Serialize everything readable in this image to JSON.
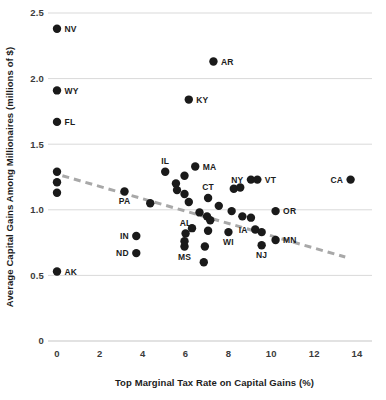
{
  "chart_data": {
    "type": "scatter",
    "title": "",
    "xlabel": "Top Marginal Tax Rate on Capital Gains (%)",
    "ylabel": "Average Capital Gains Among Millionaires (millions of $)",
    "xlim": [
      -0.7,
      14.5
    ],
    "ylim": [
      0,
      2.6
    ],
    "xticks": [
      0,
      2,
      4,
      6,
      8,
      10,
      12,
      14
    ],
    "xtick_labels": [
      "0",
      "2",
      "4",
      "6",
      "8",
      "10",
      "12",
      "14"
    ],
    "yticks": [
      0,
      0.5,
      1.0,
      1.5,
      2.0,
      2.5
    ],
    "ytick_labels": [
      "0",
      "0.5",
      "1.0",
      "1.5",
      "2.0",
      "2.5"
    ],
    "grid": "horizontal",
    "legend": "none",
    "colors": {
      "point": "#1a1a1a",
      "trendline": "#a8a8a8",
      "gridline": "#d9d9d9",
      "text": "#1c1c1c",
      "background": "#ffffff"
    },
    "trendline": {
      "style": "dashed",
      "x_start": 0.25,
      "y_start": 1.26,
      "x_end": 13.45,
      "y_end": 0.64
    },
    "points": [
      {
        "label": "NV",
        "x": 0.0,
        "y": 2.38,
        "label_pos": "right"
      },
      {
        "label": "AR",
        "x": 7.3,
        "y": 2.13,
        "label_pos": "right"
      },
      {
        "label": "WY",
        "x": 0.0,
        "y": 1.91,
        "label_pos": "right"
      },
      {
        "label": "KY",
        "x": 6.15,
        "y": 1.84,
        "label_pos": "right"
      },
      {
        "label": "FL",
        "x": 0.0,
        "y": 1.67,
        "label_pos": "right"
      },
      {
        "label": "",
        "x": 0.0,
        "y": 1.29,
        "label_pos": "none"
      },
      {
        "label": "",
        "x": 0.0,
        "y": 1.21,
        "label_pos": "none"
      },
      {
        "label": "",
        "x": 0.0,
        "y": 1.13,
        "label_pos": "none"
      },
      {
        "label": "IL",
        "x": 5.05,
        "y": 1.29,
        "label_pos": "above"
      },
      {
        "label": "MA",
        "x": 6.45,
        "y": 1.33,
        "label_pos": "right"
      },
      {
        "label": "",
        "x": 5.95,
        "y": 1.26,
        "label_pos": "none"
      },
      {
        "label": "",
        "x": 5.55,
        "y": 1.2,
        "label_pos": "none"
      },
      {
        "label": "",
        "x": 5.6,
        "y": 1.15,
        "label_pos": "none"
      },
      {
        "label": "",
        "x": 5.95,
        "y": 1.12,
        "label_pos": "none"
      },
      {
        "label": "",
        "x": 6.15,
        "y": 1.06,
        "label_pos": "none"
      },
      {
        "label": "PA",
        "x": 3.15,
        "y": 1.14,
        "label_pos": "below"
      },
      {
        "label": "",
        "x": 4.35,
        "y": 1.05,
        "label_pos": "none"
      },
      {
        "label": "CT",
        "x": 7.05,
        "y": 1.09,
        "label_pos": "above"
      },
      {
        "label": "",
        "x": 8.25,
        "y": 1.16,
        "label_pos": "none"
      },
      {
        "label": "",
        "x": 8.55,
        "y": 1.17,
        "label_pos": "none"
      },
      {
        "label": "NY",
        "x": 9.05,
        "y": 1.23,
        "label_pos": "left"
      },
      {
        "label": "VT",
        "x": 9.35,
        "y": 1.23,
        "label_pos": "right"
      },
      {
        "label": "CA",
        "x": 13.7,
        "y": 1.23,
        "label_pos": "left"
      },
      {
        "label": "OR",
        "x": 10.2,
        "y": 0.99,
        "label_pos": "right"
      },
      {
        "label": "",
        "x": 7.55,
        "y": 1.03,
        "label_pos": "none"
      },
      {
        "label": "",
        "x": 6.65,
        "y": 0.98,
        "label_pos": "none"
      },
      {
        "label": "",
        "x": 7.0,
        "y": 0.95,
        "label_pos": "none"
      },
      {
        "label": "",
        "x": 7.15,
        "y": 0.92,
        "label_pos": "none"
      },
      {
        "label": "",
        "x": 8.15,
        "y": 0.99,
        "label_pos": "none"
      },
      {
        "label": "",
        "x": 8.65,
        "y": 0.95,
        "label_pos": "none"
      },
      {
        "label": "",
        "x": 9.05,
        "y": 0.94,
        "label_pos": "none"
      },
      {
        "label": "",
        "x": 6.3,
        "y": 0.86,
        "label_pos": "none"
      },
      {
        "label": "AL",
        "x": 6.0,
        "y": 0.82,
        "label_pos": "above"
      },
      {
        "label": "",
        "x": 7.05,
        "y": 0.84,
        "label_pos": "none"
      },
      {
        "label": "WI",
        "x": 8.0,
        "y": 0.83,
        "label_pos": "below"
      },
      {
        "label": "IA",
        "x": 9.25,
        "y": 0.85,
        "label_pos": "left"
      },
      {
        "label": "",
        "x": 9.55,
        "y": 0.83,
        "label_pos": "none"
      },
      {
        "label": "MN",
        "x": 10.2,
        "y": 0.77,
        "label_pos": "right"
      },
      {
        "label": "IN",
        "x": 3.7,
        "y": 0.8,
        "label_pos": "left"
      },
      {
        "label": "MS",
        "x": 5.95,
        "y": 0.72,
        "label_pos": "below"
      },
      {
        "label": "",
        "x": 5.95,
        "y": 0.76,
        "label_pos": "none"
      },
      {
        "label": "",
        "x": 6.9,
        "y": 0.72,
        "label_pos": "none"
      },
      {
        "label": "NJ",
        "x": 9.55,
        "y": 0.73,
        "label_pos": "below"
      },
      {
        "label": "ND",
        "x": 3.7,
        "y": 0.67,
        "label_pos": "left"
      },
      {
        "label": "",
        "x": 6.85,
        "y": 0.6,
        "label_pos": "none"
      },
      {
        "label": "AK",
        "x": 0.0,
        "y": 0.53,
        "label_pos": "right"
      }
    ]
  }
}
